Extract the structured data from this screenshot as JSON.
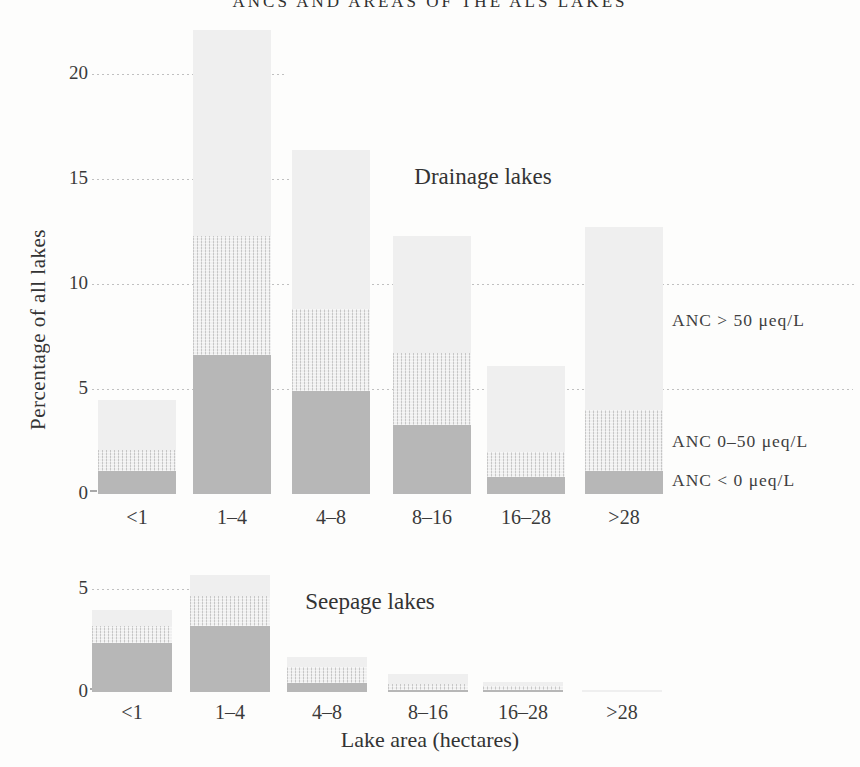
{
  "title": "ANCS AND AREAS OF THE ALS LAKES",
  "legend": {
    "items": [
      "ANC > 50 μeq/L",
      "ANC 0–50 μeq/L",
      "ANC < 0 μeq/L"
    ]
  },
  "chart_data": [
    {
      "type": "bar",
      "stacked": true,
      "title": "Drainage lakes",
      "ylabel": "Percentage of all lakes",
      "categories": [
        "<1",
        "1–4",
        "4–8",
        "8–16",
        "16–28",
        ">28"
      ],
      "series": [
        {
          "name": "ANC < 0 μeq/L",
          "values": [
            1.1,
            6.6,
            4.9,
            3.3,
            0.8,
            1.1
          ]
        },
        {
          "name": "ANC 0–50 μeq/L",
          "values": [
            1.0,
            5.7,
            3.9,
            3.4,
            1.2,
            2.9
          ]
        },
        {
          "name": "ANC > 50 μeq/L",
          "values": [
            2.4,
            9.8,
            7.6,
            5.6,
            4.1,
            8.7
          ]
        }
      ],
      "totals": [
        4.5,
        22.1,
        16.4,
        12.3,
        6.1,
        12.7
      ],
      "yticks": [
        0,
        5,
        10,
        15,
        20
      ],
      "ylim": [
        0,
        22.5
      ],
      "grid": "dotted horizontal",
      "legend_position": "right"
    },
    {
      "type": "bar",
      "stacked": true,
      "title": "Seepage lakes",
      "xlabel": "Lake area (hectares)",
      "categories": [
        "<1",
        "1–4",
        "4–8",
        "8–16",
        "16–28",
        ">28"
      ],
      "series": [
        {
          "name": "ANC < 0 μeq/L",
          "values": [
            2.4,
            3.2,
            0.45,
            0.1,
            0.1,
            0
          ]
        },
        {
          "name": "ANC 0–50 μeq/L",
          "values": [
            0.8,
            1.45,
            0.75,
            0.3,
            0.2,
            0
          ]
        },
        {
          "name": "ANC > 50 μeq/L",
          "values": [
            0.8,
            1.05,
            0.5,
            0.5,
            0.2,
            0.1
          ]
        }
      ],
      "totals": [
        4.0,
        5.7,
        1.7,
        0.9,
        0.5,
        0.1
      ],
      "yticks": [
        0,
        5
      ],
      "ylim": [
        0,
        6
      ],
      "grid": "dotted horizontal"
    }
  ]
}
